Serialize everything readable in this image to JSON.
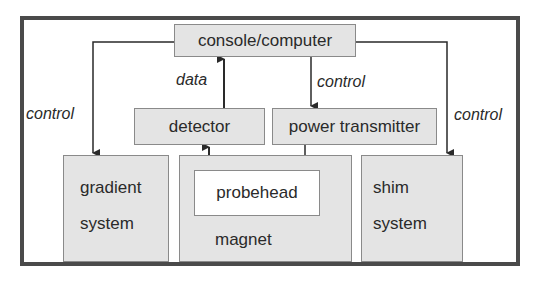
{
  "diagram": {
    "nodes": {
      "console": "console/computer",
      "detector": "detector",
      "power_transmitter": "power transmitter",
      "gradient_line1": "gradient",
      "gradient_line2": "system",
      "magnet": "magnet",
      "probehead": "probehead",
      "shim_line1": "shim",
      "shim_line2": "system"
    },
    "edge_labels": {
      "data": "data",
      "control_left": "control",
      "control_center": "control",
      "control_right": "control"
    },
    "edges": [
      {
        "from": "console",
        "to": "gradient system",
        "label": "control"
      },
      {
        "from": "console",
        "to": "power transmitter",
        "label": "control"
      },
      {
        "from": "console",
        "to": "shim system",
        "label": "control"
      },
      {
        "from": "detector",
        "to": "console",
        "label": "data"
      },
      {
        "from": "probehead",
        "to": "detector"
      },
      {
        "from": "power transmitter",
        "to": "probehead"
      }
    ],
    "colors": {
      "box_fill": "#e4e4e4",
      "frame": "#4a4a4a",
      "line": "#2a2a2a"
    }
  }
}
